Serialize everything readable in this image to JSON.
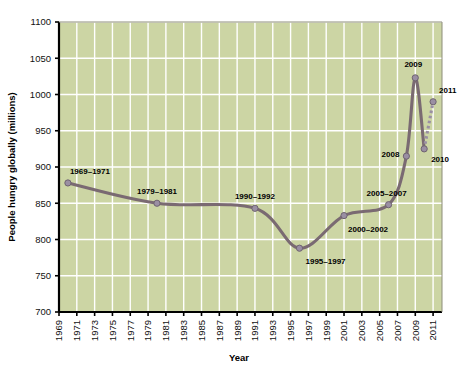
{
  "chart_data": {
    "type": "line",
    "title": "",
    "xlabel": "Year",
    "ylabel": "People hungry globally (millions)",
    "xlim": [
      1969,
      2012
    ],
    "ylim": [
      700,
      1100
    ],
    "ytick_step": 50,
    "grid": true,
    "legend": false,
    "x_tick_labels": [
      "1969",
      "1971",
      "1973",
      "1975",
      "1977",
      "1979",
      "1981",
      "1983",
      "1985",
      "1987",
      "1989",
      "1991",
      "1993",
      "1995",
      "1997",
      "1999",
      "2001",
      "2003",
      "2005",
      "2007",
      "2009",
      "2011"
    ],
    "y_tick_labels": [
      "700",
      "750",
      "800",
      "850",
      "900",
      "950",
      "1000",
      "1050",
      "1100"
    ],
    "series": [
      {
        "name": "People hungry globally",
        "points": [
          {
            "x": 1970,
            "y": 878,
            "label": "1969–1971",
            "label_pos": "above"
          },
          {
            "x": 1980,
            "y": 850,
            "label": "1979–1981",
            "label_pos": "above"
          },
          {
            "x": 1991,
            "y": 843,
            "label": "1990–1992",
            "label_pos": "above"
          },
          {
            "x": 1996,
            "y": 788,
            "label": "1995–1997",
            "label_pos": "below"
          },
          {
            "x": 2001,
            "y": 833,
            "label": "2000–2002",
            "label_pos": "below"
          },
          {
            "x": 2006,
            "y": 848,
            "label": "2005–2007",
            "label_pos": "above"
          },
          {
            "x": 2008,
            "y": 915,
            "label": "2008",
            "label_pos": "left"
          },
          {
            "x": 2009,
            "y": 1023,
            "label": "2009",
            "label_pos": "above"
          },
          {
            "x": 2010,
            "y": 925,
            "label": "2010",
            "label_pos": "below-right"
          },
          {
            "x": 2011,
            "y": 990,
            "label": "2011",
            "label_pos": "above-right",
            "projected": true
          }
        ]
      }
    ],
    "colors": {
      "plot_background": "#ccd5a4",
      "gridline": "#ffffff",
      "line": "#7a6a72",
      "marker_fill": "#9a8fa3",
      "axis": "#000000",
      "page_background": "#ffffff"
    },
    "notes": {
      "dashed_segment": "2010 to 2011 drawn as dashed (projection)"
    }
  }
}
